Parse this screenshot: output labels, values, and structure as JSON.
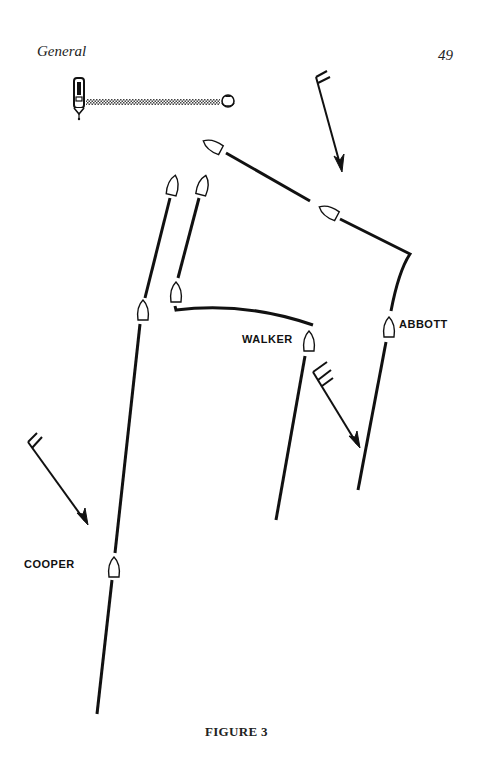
{
  "page": {
    "section_title": "General",
    "page_number": "49",
    "figure_caption": "FIGURE 3"
  },
  "diagram": {
    "type": "sailing-race-start-tracks",
    "colors": {
      "ink": "#111111",
      "starting_line_hatch": "#555555",
      "paper": "#ffffff"
    },
    "committee_boat": {
      "icon": "committee-boat-icon",
      "x": 79,
      "y": 92
    },
    "starting_line": {
      "from": [
        86,
        102
      ],
      "to": [
        220,
        102
      ],
      "style": "hatched"
    },
    "mark_buoy": {
      "icon": "buoy-icon",
      "x": 227,
      "y": 102
    },
    "wind_arrows": [
      {
        "id": "wind-top",
        "from": [
          316,
          78
        ],
        "to": [
          342,
          170
        ]
      },
      {
        "id": "wind-middle",
        "from": [
          316,
          370
        ],
        "to": [
          358,
          446
        ]
      },
      {
        "id": "wind-left",
        "from": [
          28,
          440
        ],
        "to": [
          87,
          523
        ]
      }
    ],
    "boats": [
      {
        "name": "COOPER",
        "label_pos": [
          24,
          560
        ],
        "positions": [
          {
            "x": 114,
            "y": 568,
            "heading": 0
          },
          {
            "x": 143,
            "y": 311,
            "heading": 0
          },
          {
            "x": 173,
            "y": 186,
            "heading": 0
          }
        ],
        "track": [
          [
            97,
            714
          ],
          [
            114,
            580
          ],
          [
            139,
            325
          ],
          [
            143,
            300
          ],
          [
            170,
            198
          ]
        ]
      },
      {
        "name": "WALKER",
        "label_pos": [
          242,
          334
        ],
        "positions": [
          {
            "x": 309,
            "y": 342,
            "heading": 0
          },
          {
            "x": 176,
            "y": 293,
            "heading": 0
          },
          {
            "x": 202,
            "y": 186,
            "heading": 0
          }
        ],
        "track": [
          [
            276,
            520
          ],
          [
            305,
            356
          ],
          "junction",
          [
            313,
            326
          ],
          [
            175,
            309
          ],
          "gap",
          [
            178,
            279
          ],
          [
            199,
            198
          ]
        ]
      },
      {
        "name": "ABBOTT",
        "label_pos": [
          399,
          321
        ],
        "positions": [
          {
            "x": 389,
            "y": 328,
            "heading": 0
          },
          {
            "x": 329,
            "y": 211,
            "heading": 115
          },
          {
            "x": 214,
            "y": 146,
            "heading": 115
          }
        ],
        "track": [
          [
            358,
            490
          ],
          [
            386,
            342
          ],
          [
            391,
            312
          ],
          [
            410,
            254
          ],
          [
            336,
            218
          ],
          "gap",
          [
            226,
            153
          ]
        ]
      }
    ]
  }
}
